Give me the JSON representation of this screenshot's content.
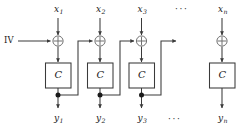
{
  "diagram": {
    "iv_label": "IV",
    "ellipsis_top": "···",
    "ellipsis_bottom": "···",
    "xor_symbol": "⊕",
    "line_color": "#3a3a3a",
    "text_color": "#1a1a1a",
    "background_color": "#ffffff",
    "columns": [
      {
        "index": 1,
        "input_label": "x",
        "input_sub": "1",
        "cipher_label": "C",
        "output_label": "y",
        "output_sub": "1",
        "has_xor": true,
        "has_feedback_tap": true
      },
      {
        "index": 2,
        "input_label": "x",
        "input_sub": "2",
        "cipher_label": "C",
        "output_label": "y",
        "output_sub": "2",
        "has_xor": true,
        "has_feedback_tap": true
      },
      {
        "index": 3,
        "input_label": "x",
        "input_sub": "3",
        "cipher_label": "C",
        "output_label": "y",
        "output_sub": "3",
        "has_xor": true,
        "has_feedback_tap": true
      },
      {
        "index": 4,
        "input_label": "x",
        "input_sub": "n",
        "cipher_label": "C",
        "output_label": "y",
        "output_sub": "n",
        "has_xor": true,
        "has_feedback_tap": false
      }
    ]
  }
}
